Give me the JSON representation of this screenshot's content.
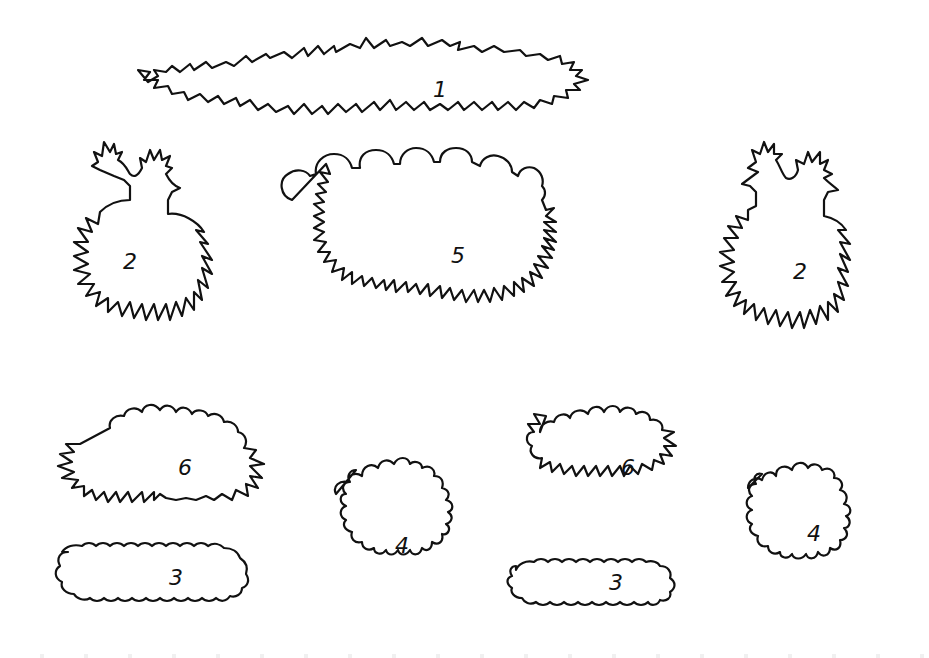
{
  "page": {
    "background": "#ffffff",
    "stroke_color": "#111111"
  },
  "shapes": [
    {
      "id": "shape-1",
      "label": "1",
      "kind": "long grass strip",
      "cx": 440,
      "cy": 90
    },
    {
      "id": "shape-2-left",
      "label": "2",
      "kind": "spiky bush with two tufts",
      "cx": 130,
      "cy": 262
    },
    {
      "id": "shape-5",
      "label": "5",
      "kind": "large scalloped bush",
      "cx": 458,
      "cy": 256
    },
    {
      "id": "shape-2-right",
      "label": "2",
      "kind": "spiky bush with two tufts",
      "cx": 800,
      "cy": 272
    },
    {
      "id": "shape-6-left",
      "label": "6",
      "kind": "oval scalloped bush",
      "cx": 185,
      "cy": 468
    },
    {
      "id": "shape-3-left",
      "label": "3",
      "kind": "flat scalloped hedge",
      "cx": 176,
      "cy": 578
    },
    {
      "id": "shape-4-left",
      "label": "4",
      "kind": "round bush",
      "cx": 402,
      "cy": 546
    },
    {
      "id": "shape-6-right",
      "label": "6",
      "kind": "oval scalloped bush",
      "cx": 628,
      "cy": 468
    },
    {
      "id": "shape-3-right",
      "label": "3",
      "kind": "flat scalloped hedge",
      "cx": 616,
      "cy": 583
    },
    {
      "id": "shape-4-right",
      "label": "4",
      "kind": "round bush",
      "cx": 814,
      "cy": 534
    }
  ]
}
